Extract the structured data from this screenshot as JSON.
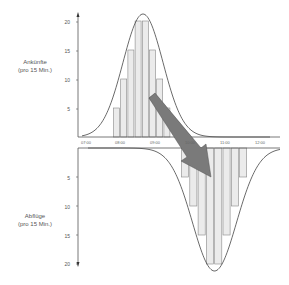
{
  "chart_data": [
    {
      "type": "bar",
      "title": "Ankünfte (pro 15 Min.)",
      "ylabel": "Ankünfte (pro 15 Min.)",
      "xlabel": "",
      "x_ticks": [
        "07:00",
        "08:00",
        "09:00",
        "10:00",
        "11:00",
        "12:00"
      ],
      "categories": [
        "08:00",
        "08:15",
        "08:30",
        "08:45",
        "09:00",
        "09:15",
        "09:30",
        "09:45"
      ],
      "values": [
        5,
        10,
        15,
        20,
        20,
        15,
        10,
        5
      ],
      "y_ticks": [
        5,
        10,
        15,
        20
      ],
      "ylim": [
        0,
        21
      ],
      "overlay": "bell-shaped distribution curve"
    },
    {
      "type": "bar",
      "title": "Abflüge (pro 15 Min.)",
      "ylabel": "Abflüge (pro 15 Min.)",
      "xlabel": "",
      "categories": [
        "10:00",
        "10:15",
        "10:30",
        "10:45",
        "11:00",
        "11:15",
        "11:30",
        "11:45"
      ],
      "values": [
        5,
        10,
        15,
        20,
        20,
        15,
        10,
        5
      ],
      "y_ticks": [
        5,
        10,
        15,
        20
      ],
      "ylim": [
        0,
        21
      ],
      "direction": "downward",
      "overlay": "inverted bell-shaped distribution curve"
    }
  ],
  "labels": {
    "upper_line1": "Ankünfte",
    "upper_line2": "(pro 15 Min.)",
    "lower_line1": "Abflüge",
    "lower_line2": "(pro 15 Min.)"
  },
  "x_ticks": [
    "07:00",
    "08:00",
    "09:00",
    "10:00",
    "11:00",
    "12:00"
  ],
  "y_ticks_upper": [
    "20",
    "15",
    "10",
    "5"
  ],
  "y_ticks_lower": [
    "5",
    "10",
    "15",
    "20"
  ],
  "colors": {
    "bar_fill": "#ebebeb",
    "bar_stroke": "#888888",
    "axis": "#555555",
    "curve": "#444444",
    "arrow": "#777777"
  }
}
